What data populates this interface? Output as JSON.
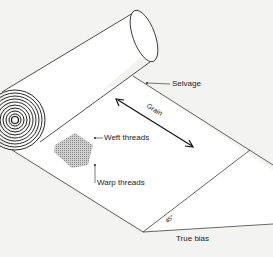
{
  "diagram": {
    "labels": {
      "selvage": "Selvage",
      "grain": "Grain",
      "weft": "Weft threads",
      "warp": "Warp threads",
      "angle": "45°",
      "bias": "True bias"
    },
    "colors": {
      "background": "#f3f3f1",
      "fabric": "#ffffff",
      "line": "#222222",
      "weave": "#9a9a9a"
    }
  }
}
